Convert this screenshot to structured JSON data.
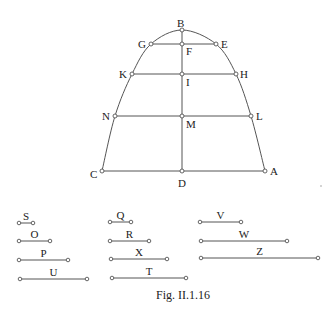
{
  "figure": {
    "caption": "Fig. II.1.16",
    "caption_pos": [
      183,
      299
    ],
    "curve": {
      "description": "parabola-like arch from C through B to A",
      "left_path": [
        [
          102,
          171
        ],
        [
          115,
          116
        ],
        [
          132,
          74
        ],
        [
          151,
          44
        ],
        [
          182,
          30
        ]
      ],
      "right_path": [
        [
          182,
          30
        ],
        [
          216,
          44
        ],
        [
          236,
          74
        ],
        [
          251,
          116
        ],
        [
          265,
          171
        ]
      ]
    },
    "points": [
      {
        "name": "B",
        "xy": [
          182,
          30
        ],
        "label_xy": [
          177,
          27
        ]
      },
      {
        "name": "F",
        "xy": [
          182,
          44
        ],
        "label_xy": [
          186,
          55
        ]
      },
      {
        "name": "G",
        "xy": [
          151,
          44
        ],
        "label_xy": [
          138,
          48
        ]
      },
      {
        "name": "E",
        "xy": [
          216,
          44
        ],
        "label_xy": [
          221,
          48
        ]
      },
      {
        "name": "I",
        "xy": [
          182,
          74
        ],
        "label_xy": [
          186,
          86
        ]
      },
      {
        "name": "K",
        "xy": [
          132,
          74
        ],
        "label_xy": [
          119,
          78
        ]
      },
      {
        "name": "H",
        "xy": [
          236,
          74
        ],
        "label_xy": [
          240,
          78
        ]
      },
      {
        "name": "M",
        "xy": [
          182,
          116
        ],
        "label_xy": [
          186,
          128
        ]
      },
      {
        "name": "N",
        "xy": [
          115,
          116
        ],
        "label_xy": [
          102,
          120
        ]
      },
      {
        "name": "L",
        "xy": [
          251,
          116
        ],
        "label_xy": [
          256,
          120
        ]
      },
      {
        "name": "D",
        "xy": [
          182,
          171
        ],
        "label_xy": [
          178,
          187
        ]
      },
      {
        "name": "C",
        "xy": [
          102,
          171
        ],
        "label_xy": [
          90,
          178
        ]
      },
      {
        "name": "A",
        "xy": [
          265,
          171
        ],
        "label_xy": [
          270,
          175
        ]
      }
    ],
    "lines": [
      {
        "name": "GE",
        "from": "G",
        "to": "E"
      },
      {
        "name": "KH",
        "from": "K",
        "to": "H"
      },
      {
        "name": "NL",
        "from": "N",
        "to": "L"
      },
      {
        "name": "CA",
        "from": "C",
        "to": "A"
      },
      {
        "name": "BD",
        "from": "B",
        "to": "D"
      }
    ],
    "segments": [
      {
        "label": "S",
        "x1": 19,
        "x2": 33,
        "y": 223
      },
      {
        "label": "O",
        "x1": 19,
        "x2": 50,
        "y": 241
      },
      {
        "label": "P",
        "x1": 19,
        "x2": 68,
        "y": 260
      },
      {
        "label": "U",
        "x1": 20,
        "x2": 87,
        "y": 279
      },
      {
        "label": "Q",
        "x1": 110,
        "x2": 131,
        "y": 222
      },
      {
        "label": "R",
        "x1": 110,
        "x2": 149,
        "y": 241
      },
      {
        "label": "X",
        "x1": 111,
        "x2": 167,
        "y": 259
      },
      {
        "label": "T",
        "x1": 112,
        "x2": 186,
        "y": 278
      },
      {
        "label": "V",
        "x1": 200,
        "x2": 241,
        "y": 222
      },
      {
        "label": "W",
        "x1": 201,
        "x2": 287,
        "y": 241
      },
      {
        "label": "Z",
        "x1": 201,
        "x2": 318,
        "y": 258
      }
    ],
    "stray_dot": [
      321,
      186
    ]
  }
}
